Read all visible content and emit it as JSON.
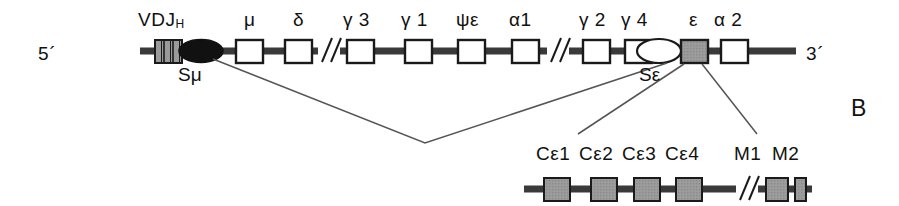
{
  "figure": {
    "panel_letter": "B",
    "end_labels": {
      "five_prime": "5´",
      "three_prime": "3´"
    }
  },
  "colors": {
    "line": "#3a3a3a",
    "text": "#111111",
    "box_stroke": "#1a1a1a",
    "box_empty_fill": "#ffffff",
    "box_epsilon_fill": "#9a9a9a",
    "vdj_fill": "#9a9a9a",
    "switch_mu_fill": "#111111",
    "switch_eps_fill": "#ffffff",
    "connector": "#555555"
  },
  "top_locus": {
    "name": "immunoglobulin-heavy-chain-constant-region-locus",
    "vdj": {
      "label": "VDJ",
      "subscript": "H",
      "x": 155,
      "y": 40,
      "width": 26,
      "height": 22,
      "stripes": 3
    },
    "switch_regions": [
      {
        "name": "S-mu",
        "label": "Sμ",
        "shape": "filled-ellipse",
        "cx": 200,
        "cy": 51,
        "rx": 22,
        "ry": 11,
        "label_x": 179,
        "label_y": 66
      },
      {
        "name": "S-epsilon",
        "label": "Sε",
        "shape": "open-ellipse",
        "cx": 660,
        "cy": 51,
        "rx": 22,
        "ry": 12,
        "label_x": 641,
        "label_y": 66
      }
    ],
    "genes": [
      {
        "name": "mu",
        "label": "μ",
        "x": 236,
        "y": 40,
        "width": 27,
        "height": 23,
        "fill": "empty",
        "label_x": 244,
        "label_y": 12
      },
      {
        "name": "delta",
        "label": "δ",
        "x": 285,
        "y": 40,
        "width": 27,
        "height": 23,
        "fill": "empty",
        "label_x": 293,
        "label_y": 12
      },
      {
        "name": "gamma3",
        "label": "γ 3",
        "x": 347,
        "y": 40,
        "width": 27,
        "height": 23,
        "fill": "empty",
        "label_x": 345,
        "label_y": 12
      },
      {
        "name": "gamma1",
        "label": "γ 1",
        "x": 405,
        "y": 40,
        "width": 27,
        "height": 23,
        "fill": "empty",
        "label_x": 403,
        "label_y": 12
      },
      {
        "name": "psi-epsilon",
        "label": "ψε",
        "x": 458,
        "y": 40,
        "width": 27,
        "height": 23,
        "fill": "empty",
        "label_x": 457,
        "label_y": 12
      },
      {
        "name": "alpha1",
        "label": "α1",
        "x": 512,
        "y": 40,
        "width": 27,
        "height": 23,
        "fill": "empty",
        "label_x": 509,
        "label_y": 12
      },
      {
        "name": "gamma2",
        "label": "γ 2",
        "x": 583,
        "y": 40,
        "width": 27,
        "height": 23,
        "fill": "empty",
        "label_x": 581,
        "label_y": 12
      },
      {
        "name": "gamma4",
        "label": "γ 4",
        "x": 625,
        "y": 40,
        "width": 27,
        "height": 23,
        "fill": "empty",
        "label_x": 608,
        "label_y": 12
      },
      {
        "name": "epsilon",
        "label": "ε",
        "x": 681,
        "y": 40,
        "width": 27,
        "height": 23,
        "fill": "gray",
        "label_x": 689,
        "label_y": 12
      },
      {
        "name": "alpha2",
        "label": "α 2",
        "x": 721,
        "y": 40,
        "width": 27,
        "height": 23,
        "fill": "empty",
        "label_x": 715,
        "label_y": 12
      }
    ],
    "breaks": [
      {
        "name": "break-1",
        "x": 325
      },
      {
        "name": "break-2",
        "x": 554
      }
    ],
    "backbone": {
      "x1": 140,
      "x2": 796,
      "y": 51
    },
    "five_prime_pos": {
      "x": 38,
      "y": 44
    },
    "three_prime_pos": {
      "x": 806,
      "y": 44
    }
  },
  "epsilon_expansion": {
    "name": "epsilon-gene-exon-structure",
    "backbone": {
      "x1": 524,
      "x2": 812,
      "y": 189
    },
    "exons": [
      {
        "name": "c-epsilon-1",
        "label": "Cε1",
        "x": 544,
        "y": 178,
        "width": 26,
        "height": 22
      },
      {
        "name": "c-epsilon-2",
        "label": "Cε2",
        "x": 591,
        "y": 178,
        "width": 26,
        "height": 22
      },
      {
        "name": "c-epsilon-3",
        "label": "Cε3",
        "x": 634,
        "y": 178,
        "width": 26,
        "height": 22
      },
      {
        "name": "c-epsilon-4",
        "label": "Cε4",
        "x": 676,
        "y": 178,
        "width": 26,
        "height": 22
      },
      {
        "name": "m1-exon",
        "label": "M1",
        "x": 766,
        "y": 178,
        "width": 22,
        "height": 22
      },
      {
        "name": "m2-exon",
        "label": "M2",
        "x": 795,
        "y": 178,
        "width": 11,
        "height": 22
      }
    ],
    "exon_labels": [
      {
        "text": "Cε1",
        "x": 537,
        "y": 144
      },
      {
        "text": "Cε2",
        "x": 580,
        "y": 144
      },
      {
        "text": "Cε3",
        "x": 623,
        "y": 144
      },
      {
        "text": "Cε4",
        "x": 666,
        "y": 144
      },
      {
        "text": "M1",
        "x": 736,
        "y": 144
      },
      {
        "text": "M2",
        "x": 773,
        "y": 144
      }
    ],
    "break": {
      "name": "break-3",
      "x": 742
    }
  },
  "connectors": {
    "switch_recombination": {
      "name": "switch-recombination-line",
      "from_s_mu": {
        "x": 215,
        "y": 58
      },
      "vertex": {
        "x": 425,
        "y": 143
      },
      "to_s_eps": {
        "x": 668,
        "y": 62
      }
    },
    "expansion_lines": [
      {
        "name": "expansion-line-left",
        "x1": 684,
        "y1": 63,
        "x2": 578,
        "y2": 133
      },
      {
        "name": "expansion-line-right",
        "x1": 703,
        "y1": 63,
        "x2": 757,
        "y2": 133
      }
    ]
  }
}
